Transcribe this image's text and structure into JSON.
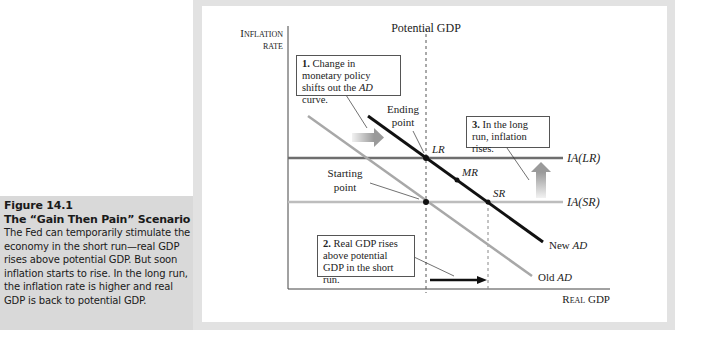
{
  "caption": {
    "figure_number": "Figure 14.1",
    "title": "The “Gain Then Pain” Scenario",
    "body": "The Fed can temporarily stimulate the economy in the short run—real GDP rises above potential GDP. But soon inflation starts to rise. In the long run, the inflation rate is higher and real GDP is back to potential GDP."
  },
  "diagram": {
    "y_axis_label_line1": "Inflation",
    "y_axis_label_line2": "rate",
    "x_axis_label": "Real GDP",
    "potential_gdp_label": "Potential GDP",
    "curves": {
      "new_ad": {
        "prefix": "New ",
        "name": "AD",
        "color": "#111111"
      },
      "old_ad": {
        "prefix": "Old ",
        "name": "AD",
        "color": "#a8a8a8"
      },
      "ia_lr": {
        "label": "IA(LR)",
        "color": "#6e6e6e"
      },
      "ia_sr": {
        "label": "IA(SR)",
        "color": "#bdbdbd"
      }
    },
    "points": {
      "lr": "LR",
      "mr": "MR",
      "sr": "SR",
      "ending_line1": "Ending",
      "ending_line2": "point",
      "starting_line1": "Starting",
      "starting_line2": "point"
    },
    "notes": {
      "note1": {
        "num": "1.",
        "text_a": " Change in monetary policy shifts out the ",
        "italic": "AD",
        "text_b": " curve."
      },
      "note2": {
        "num": "2.",
        "text": " Real GDP rises above potential GDP in the short run."
      },
      "note3": {
        "num": "3.",
        "text": " In the long run, inflation rises."
      }
    }
  }
}
